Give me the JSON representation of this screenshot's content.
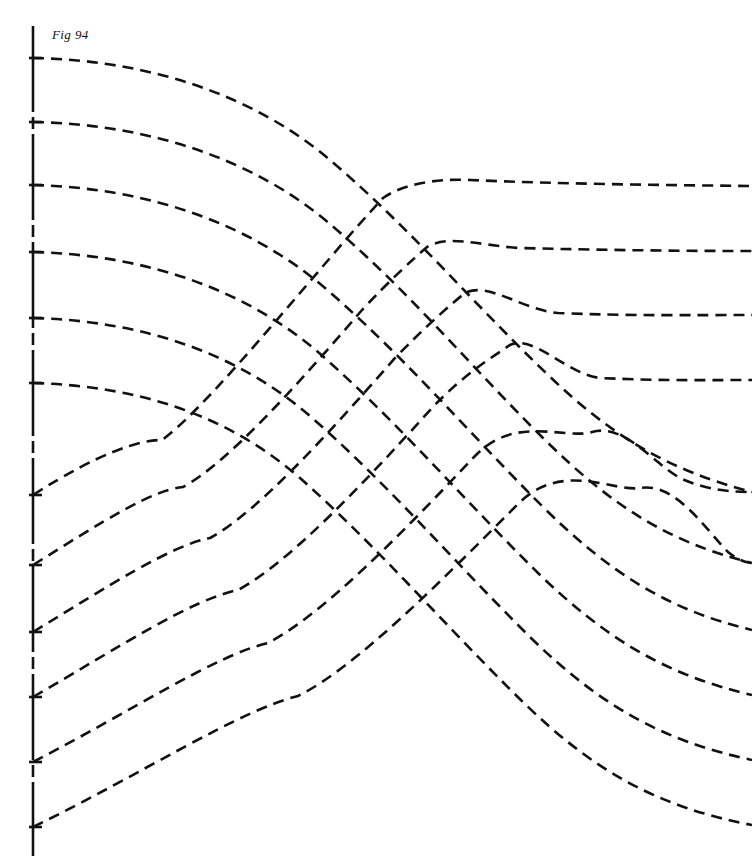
{
  "figure": {
    "caption": "Fig 94",
    "caption_position": {
      "x": 52,
      "y": 27
    },
    "canvas": {
      "width": 752,
      "height": 864
    },
    "background_color": "#ffffff",
    "ink_color": "#111111"
  },
  "style": {
    "curve_stroke_color": "#111111",
    "curve_stroke_width": 2.6,
    "curve_dash_pattern": "11 7",
    "axis_stroke_color": "#111111",
    "axis_stroke_width": 2.6,
    "axis_dash_pattern": "86 5 12 5"
  },
  "axis": {
    "name": "vertical-datum-line",
    "x": 33,
    "y_top": 26,
    "y_bottom": 856,
    "tick_marks": [
      {
        "y": 58,
        "length": 9
      },
      {
        "y": 122,
        "length": 9
      },
      {
        "y": 185,
        "length": 9
      },
      {
        "y": 252,
        "length": 9
      },
      {
        "y": 318,
        "length": 9
      },
      {
        "y": 383,
        "length": 9
      },
      {
        "y": 495,
        "length": 9
      },
      {
        "y": 565,
        "length": 9
      },
      {
        "y": 632,
        "length": 9
      },
      {
        "y": 697,
        "length": 9
      },
      {
        "y": 762,
        "length": 9
      },
      {
        "y": 827,
        "length": 9
      }
    ]
  },
  "chart_data": {
    "type": "line",
    "title": "Fig 94",
    "xlabel": "",
    "ylabel": "",
    "xlim": [
      0,
      752
    ],
    "ylim": [
      0,
      864
    ],
    "grid": false,
    "legend": "none",
    "axis_left_contacts": [
      58,
      122,
      185,
      252,
      318,
      383,
      495,
      565,
      632,
      697,
      762,
      827
    ],
    "right_edge_contacts": [
      57,
      121,
      186,
      251,
      315,
      380,
      492,
      563,
      630,
      695,
      760,
      825
    ],
    "series": [
      {
        "name": "upper-stream-1",
        "family": "upper",
        "index": 1,
        "path": "M 33,58 C 150,60 255,96 330,160 C 410,228 470,300 545,372 C 612,437 668,470 752,492"
      },
      {
        "name": "upper-stream-2",
        "family": "upper",
        "index": 2,
        "path": "M 33,122 C 150,124 255,160 330,224 C 410,292 470,366 545,440 C 612,506 668,542 752,563"
      },
      {
        "name": "upper-stream-3",
        "family": "upper",
        "index": 3,
        "path": "M 33,185 C 150,188 250,224 325,288 C 405,357 468,432 543,507 C 610,573 668,610 752,630"
      },
      {
        "name": "upper-stream-4",
        "family": "upper",
        "index": 4,
        "path": "M 33,252 C 148,255 245,290 318,352 C 398,422 462,498 538,573 C 606,639 666,675 752,695"
      },
      {
        "name": "upper-stream-5",
        "family": "upper",
        "index": 5,
        "path": "M 33,318 C 145,321 238,354 310,416 C 390,486 455,563 532,639 C 600,705 662,741 752,760"
      },
      {
        "name": "upper-stream-6",
        "family": "upper",
        "index": 6,
        "path": "M 33,383 C 142,386 230,417 300,478 C 380,549 447,628 525,704 C 594,771 658,807 752,825"
      },
      {
        "name": "lower-arc-1",
        "family": "lower",
        "index": 1,
        "cusp": {
          "x": 383,
          "y": 198
        },
        "path": "M 33,495 C 100,452 140,440 162,440 C 200,412 268,330 330,258 C 352,232 372,210 383,198 C 400,186 432,178 470,180 C 560,184 660,185 752,186"
      },
      {
        "name": "lower-arc-2",
        "family": "lower",
        "index": 2,
        "cusp": {
          "x": 427,
          "y": 247
        },
        "path": "M 33,565 C 105,520 152,490 183,487 C 228,463 300,382 362,310 C 388,282 412,260 427,247 C 448,234 482,246 520,248 C 600,250 676,251 752,251"
      },
      {
        "name": "lower-arc-3",
        "family": "lower",
        "index": 3,
        "cusp": {
          "x": 465,
          "y": 293
        },
        "path": "M 33,632 C 110,585 170,546 210,538 C 258,512 330,432 395,358 C 424,328 450,305 465,293 C 488,281 522,310 558,313 C 630,316 694,315 752,315"
      },
      {
        "name": "lower-arc-4",
        "family": "lower",
        "index": 4,
        "cusp": {
          "x": 510,
          "y": 345
        },
        "path": "M 33,697 C 118,648 190,600 238,590 C 290,562 365,482 432,408 C 464,374 494,356 510,345 C 534,334 566,374 600,378 C 666,381 712,380 752,380"
      },
      {
        "name": "lower-arc-5",
        "family": "lower",
        "index": 5,
        "cusp": {
          "x": 592,
          "y": 432
        },
        "path": "M 33,762 C 130,712 216,655 268,643 C 325,613 405,530 475,456 C 515,414 565,440 592,432 C 624,423 652,462 680,478 C 706,490 730,492 752,492"
      },
      {
        "name": "lower-arc-6",
        "family": "lower",
        "index": 6,
        "cusp": {
          "x": 640,
          "y": 488
        },
        "path": "M 33,827 C 140,775 240,710 298,696 C 358,666 444,578 518,504 C 562,460 612,492 640,488 C 676,482 706,530 728,552 C 738,560 746,563 752,563"
      }
    ],
    "cusps": [
      {
        "x": 383,
        "y": 198
      },
      {
        "x": 427,
        "y": 247
      },
      {
        "x": 465,
        "y": 293
      },
      {
        "x": 510,
        "y": 345
      },
      {
        "x": 592,
        "y": 432
      },
      {
        "x": 640,
        "y": 488
      },
      {
        "x": 162,
        "y": 440
      },
      {
        "x": 183,
        "y": 487
      },
      {
        "x": 210,
        "y": 538
      },
      {
        "x": 238,
        "y": 590
      },
      {
        "x": 268,
        "y": 643
      },
      {
        "x": 298,
        "y": 696
      }
    ]
  }
}
